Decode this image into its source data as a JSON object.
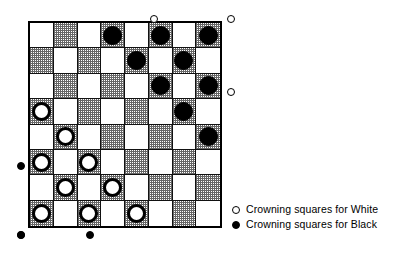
{
  "diagram": {
    "board": {
      "rows": 8,
      "cols": 8,
      "dark_square_color": "#bdbdbd",
      "light_square_color": "#ffffff",
      "border_color": "#000000"
    },
    "squares": [
      [
        "light",
        "dark",
        "light",
        "dark",
        "light",
        "dark",
        "light",
        "dark"
      ],
      [
        "dark",
        "light",
        "dark",
        "light",
        "dark",
        "light",
        "dark",
        "light"
      ],
      [
        "light",
        "dark",
        "light",
        "dark",
        "light",
        "dark",
        "light",
        "dark"
      ],
      [
        "dark",
        "light",
        "dark",
        "light",
        "dark",
        "light",
        "dark",
        "light"
      ],
      [
        "light",
        "dark",
        "light",
        "dark",
        "light",
        "dark",
        "light",
        "dark"
      ],
      [
        "dark",
        "light",
        "dark",
        "light",
        "dark",
        "light",
        "dark",
        "light"
      ],
      [
        "light",
        "dark",
        "light",
        "dark",
        "light",
        "dark",
        "light",
        "dark"
      ],
      [
        "dark",
        "light",
        "dark",
        "light",
        "dark",
        "light",
        "dark",
        "light"
      ]
    ],
    "pieces": [
      {
        "row": 1,
        "col": 4,
        "color": "black"
      },
      {
        "row": 1,
        "col": 6,
        "color": "black"
      },
      {
        "row": 1,
        "col": 8,
        "color": "black"
      },
      {
        "row": 2,
        "col": 5,
        "color": "black"
      },
      {
        "row": 2,
        "col": 7,
        "color": "black"
      },
      {
        "row": 3,
        "col": 6,
        "color": "black"
      },
      {
        "row": 3,
        "col": 8,
        "color": "black"
      },
      {
        "row": 4,
        "col": 7,
        "color": "black"
      },
      {
        "row": 5,
        "col": 8,
        "color": "black"
      },
      {
        "row": 4,
        "col": 1,
        "color": "white"
      },
      {
        "row": 5,
        "col": 2,
        "color": "white"
      },
      {
        "row": 6,
        "col": 1,
        "color": "white"
      },
      {
        "row": 6,
        "col": 3,
        "color": "white"
      },
      {
        "row": 7,
        "col": 2,
        "color": "white"
      },
      {
        "row": 7,
        "col": 4,
        "color": "white"
      },
      {
        "row": 8,
        "col": 1,
        "color": "white"
      },
      {
        "row": 8,
        "col": 3,
        "color": "white"
      },
      {
        "row": 8,
        "col": 5,
        "color": "white"
      }
    ],
    "markers": [
      {
        "id": "white-crown-top-1",
        "style": "open",
        "side": "top",
        "x": 150,
        "y": 15
      },
      {
        "id": "white-crown-top-2",
        "style": "open",
        "side": "top",
        "x": 227,
        "y": 15
      },
      {
        "id": "white-crown-right-1",
        "style": "open",
        "side": "right",
        "x": 227,
        "y": 88
      },
      {
        "id": "black-crown-left-1",
        "style": "filled",
        "side": "left",
        "x": 17,
        "y": 162
      },
      {
        "id": "black-crown-left-2",
        "style": "filled",
        "side": "left",
        "x": 17,
        "y": 231
      },
      {
        "id": "black-crown-bottom-1",
        "style": "filled",
        "side": "bottom",
        "x": 17,
        "y": 231
      },
      {
        "id": "black-crown-bottom-2",
        "style": "filled",
        "side": "bottom",
        "x": 86,
        "y": 231
      }
    ]
  },
  "legend": {
    "white_marker": "open-circle-icon",
    "white_label": "Crowning squares for White",
    "black_marker": "filled-circle-icon",
    "black_label": "Crowning squares for Black"
  }
}
